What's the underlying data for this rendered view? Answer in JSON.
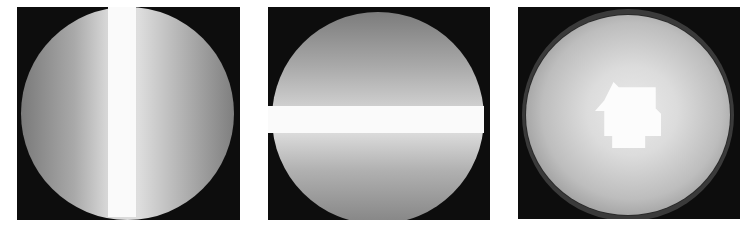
{
  "figure": {
    "panel_count": 3,
    "background_color": "#ffffff",
    "panel_background_color": "#0d0d0d",
    "panels": [
      {
        "index": 1,
        "description": "Grayscale shaded disc with left-to-right intensity gradient and a vertical saturated white band slightly left of center",
        "band_orientation": "vertical",
        "band_color": "#fafafa"
      },
      {
        "index": 2,
        "description": "Grayscale shaded disc with top-to-bottom intensity gradient and a horizontal saturated white band just above center",
        "band_orientation": "horizontal",
        "band_color": "#fafafa"
      },
      {
        "index": 3,
        "description": "Grayscale radially shaded sphere with outer ring and an irregular saturated white highlight patch near the center",
        "highlight_shape": "irregular polygon",
        "highlight_color": "#fcfcfc"
      }
    ]
  }
}
